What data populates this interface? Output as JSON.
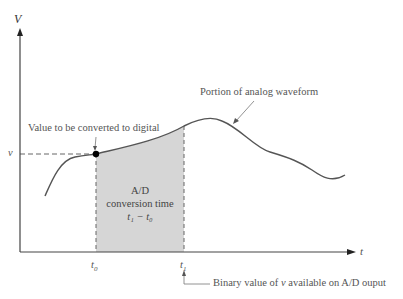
{
  "diagram": {
    "y_axis_label": "V",
    "x_axis_label": "t",
    "v_label": "v",
    "t0_label": "t",
    "t0_sub": "0",
    "t1_label": "t",
    "t1_sub": "1",
    "annotation_value": "Value to be converted to digital",
    "annotation_waveform": "Portion of analog waveform",
    "box_title_line1": "A/D",
    "box_title_line2": "conversion time",
    "box_formula": "t₁ − t₀",
    "annotation_binary_prefix": "Binary value of ",
    "annotation_binary_var": "v",
    "annotation_binary_suffix": " available on A/D ouput",
    "colors": {
      "curve": "#555555",
      "axis": "#444444",
      "shade": "#d6d6d6",
      "text": "#555555"
    }
  }
}
